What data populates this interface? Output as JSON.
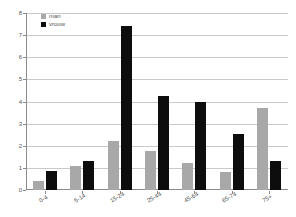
{
  "chart_data": {
    "type": "bar",
    "title": "",
    "xlabel": "",
    "ylabel": "",
    "categories": [
      "0-4",
      "5-14",
      "15-24",
      "25-44",
      "45-64",
      "65-74",
      "75+"
    ],
    "series": [
      {
        "name": "man",
        "color": "#a8a8a8",
        "values": [
          0.4,
          1.1,
          2.2,
          1.75,
          1.2,
          0.8,
          3.7
        ]
      },
      {
        "name": "vrouw",
        "color": "#0d0d0d",
        "values": [
          0.85,
          1.3,
          7.4,
          4.25,
          4.0,
          2.55,
          1.3
        ]
      }
    ],
    "ylim": [
      0,
      8
    ],
    "yticks": [
      0,
      1,
      2,
      3,
      4,
      5,
      6,
      7,
      8
    ],
    "ytick_labels": [
      "0",
      "1",
      "2",
      "3",
      "4",
      "5",
      "6",
      "7",
      "8"
    ],
    "grid": true,
    "legend_position": "top-left"
  },
  "legend": {
    "items": [
      {
        "label": "man"
      },
      {
        "label": "vrouw"
      }
    ]
  }
}
